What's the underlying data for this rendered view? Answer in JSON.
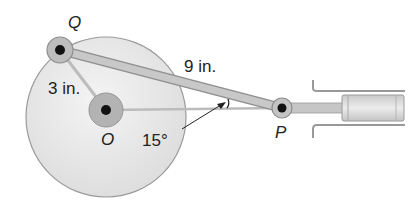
{
  "diagram": {
    "points": {
      "Q": "Q",
      "O": "O",
      "P": "P"
    },
    "labels": {
      "radius": "3 in.",
      "rod": "9 in.",
      "angle": "15°"
    },
    "colors": {
      "disc": "#e6e6e6",
      "disc_edge": "#9a9a9a",
      "rod": "#bdbdbd",
      "hub": "#a8a8a8",
      "pin": "#111111"
    }
  }
}
